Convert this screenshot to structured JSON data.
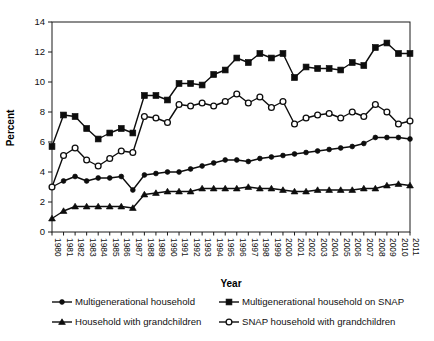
{
  "chart_data": {
    "type": "line",
    "title": "",
    "xlabel": "Year",
    "ylabel": "Percent",
    "ylim": [
      0,
      14
    ],
    "yticks": [
      0,
      2,
      4,
      6,
      8,
      10,
      12,
      14
    ],
    "grid": false,
    "legend_position": "bottom",
    "categories": [
      "1980",
      "1981",
      "1982",
      "1983",
      "1984",
      "1985",
      "1986",
      "1987",
      "1988",
      "1989",
      "1990",
      "1991",
      "1992",
      "1993",
      "1994",
      "1995",
      "1996",
      "1997",
      "1998",
      "1999",
      "2000",
      "2001",
      "2002",
      "2003",
      "2004",
      "2005",
      "2006",
      "2007",
      "2008",
      "2009",
      "2010",
      "2011"
    ],
    "series": [
      {
        "name": "Multigenerational household",
        "marker": "filled-circle",
        "values": [
          3.0,
          3.4,
          3.7,
          3.4,
          3.6,
          3.6,
          3.7,
          2.8,
          3.8,
          3.9,
          4.0,
          4.0,
          4.2,
          4.4,
          4.6,
          4.8,
          4.8,
          4.7,
          4.9,
          5.0,
          5.1,
          5.2,
          5.3,
          5.4,
          5.5,
          5.6,
          5.7,
          5.9,
          6.3,
          6.3,
          6.3,
          6.2
        ]
      },
      {
        "name": "Multigenerational household on SNAP",
        "marker": "filled-square",
        "values": [
          5.7,
          7.8,
          7.7,
          6.9,
          6.2,
          6.6,
          6.9,
          6.6,
          9.1,
          9.1,
          8.8,
          9.9,
          9.9,
          9.8,
          10.5,
          10.8,
          11.6,
          11.3,
          11.9,
          11.6,
          11.9,
          10.3,
          11.0,
          10.9,
          10.9,
          10.8,
          11.3,
          11.1,
          12.3,
          12.6,
          11.9,
          11.9
        ]
      },
      {
        "name": "Household with grandchildren",
        "marker": "filled-triangle",
        "values": [
          0.9,
          1.4,
          1.7,
          1.7,
          1.7,
          1.7,
          1.7,
          1.6,
          2.5,
          2.6,
          2.7,
          2.7,
          2.7,
          2.9,
          2.9,
          2.9,
          2.9,
          3.0,
          2.9,
          2.9,
          2.8,
          2.7,
          2.7,
          2.8,
          2.8,
          2.8,
          2.8,
          2.9,
          2.9,
          3.1,
          3.2,
          3.1
        ]
      },
      {
        "name": "SNAP household with grandchildren",
        "marker": "open-circle",
        "values": [
          3.0,
          5.1,
          5.6,
          4.8,
          4.4,
          4.9,
          5.4,
          5.3,
          7.7,
          7.6,
          7.3,
          8.5,
          8.4,
          8.6,
          8.4,
          8.7,
          9.2,
          8.6,
          9.0,
          8.3,
          8.7,
          7.2,
          7.6,
          7.8,
          7.9,
          7.6,
          8.0,
          7.7,
          8.5,
          8.0,
          7.2,
          7.4
        ]
      }
    ]
  },
  "axes": {
    "y_axis_title": "Percent",
    "x_axis_title": "Year"
  },
  "legend": {
    "entries": [
      {
        "label": "Multigenerational household",
        "marker": "filled-circle"
      },
      {
        "label": "Multigenerational household on SNAP",
        "marker": "filled-square"
      },
      {
        "label": "Household with grandchildren",
        "marker": "filled-triangle"
      },
      {
        "label": "SNAP household with grandchildren",
        "marker": "open-circle"
      }
    ]
  }
}
